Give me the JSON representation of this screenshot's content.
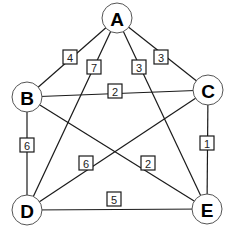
{
  "diagram": {
    "type": "weighted-undirected-graph",
    "nodes": [
      {
        "id": "A",
        "label": "A",
        "x": 117,
        "y": 18
      },
      {
        "id": "B",
        "label": "B",
        "x": 27,
        "y": 97
      },
      {
        "id": "C",
        "label": "C",
        "x": 208,
        "y": 90
      },
      {
        "id": "D",
        "label": "D",
        "x": 27,
        "y": 210
      },
      {
        "id": "E",
        "label": "E",
        "x": 207,
        "y": 209
      }
    ],
    "edges": [
      {
        "from": "A",
        "to": "B",
        "weight": "4",
        "lx": 70,
        "ly": 57
      },
      {
        "from": "A",
        "to": "D",
        "weight": "7",
        "lx": 94,
        "ly": 67
      },
      {
        "from": "A",
        "to": "E",
        "weight": "3",
        "lx": 139,
        "ly": 67
      },
      {
        "from": "A",
        "to": "C",
        "weight": "3",
        "lx": 161,
        "ly": 57
      },
      {
        "from": "B",
        "to": "C",
        "weight": "2",
        "lx": 115,
        "ly": 91
      },
      {
        "from": "B",
        "to": "D",
        "weight": "6",
        "lx": 27,
        "ly": 145
      },
      {
        "from": "C",
        "to": "D",
        "weight": "6",
        "lx": 86,
        "ly": 163
      },
      {
        "from": "B",
        "to": "E",
        "weight": "2",
        "lx": 148,
        "ly": 163
      },
      {
        "from": "C",
        "to": "E",
        "weight": "1",
        "lx": 207,
        "ly": 143
      },
      {
        "from": "D",
        "to": "E",
        "weight": "5",
        "lx": 114,
        "ly": 199
      }
    ]
  }
}
